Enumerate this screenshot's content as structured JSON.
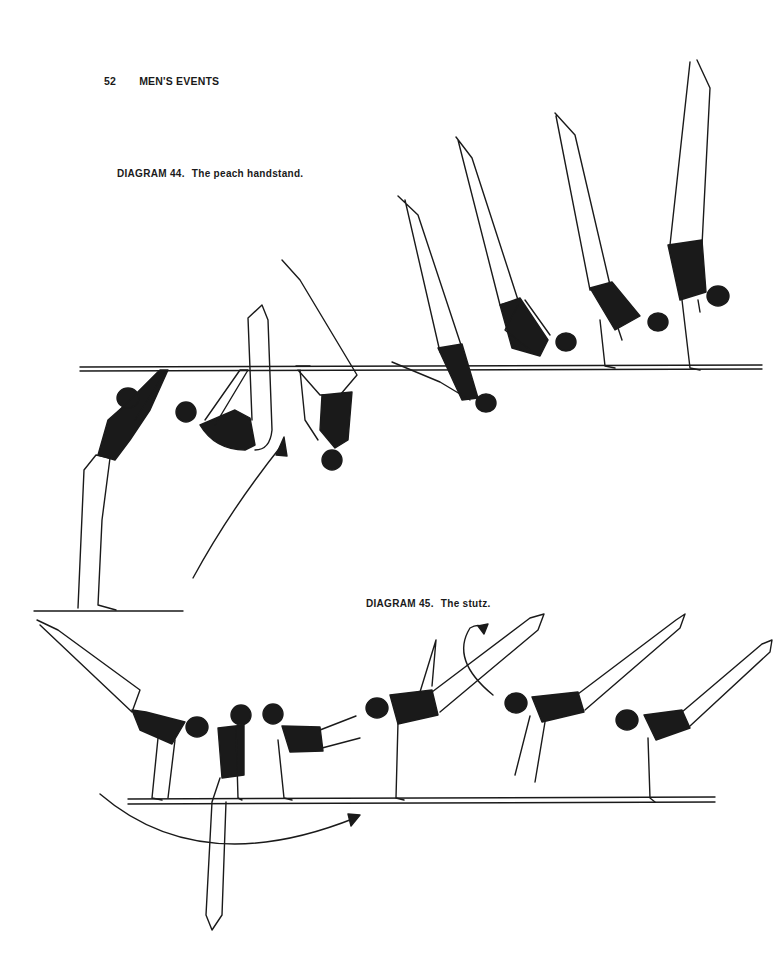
{
  "page": {
    "number": "52",
    "running_head": "MEN'S EVENTS"
  },
  "diagrams": [
    {
      "label": "DIAGRAM 44.",
      "title": "The peach handstand.",
      "figure_count": 8,
      "apparatus": "horizontal bar"
    },
    {
      "label": "DIAGRAM 45.",
      "title": "The stutz.",
      "figure_count": 7,
      "apparatus": "parallel bar"
    }
  ],
  "colors": {
    "ink": "#1a1a1a",
    "paper": "#ffffff"
  }
}
